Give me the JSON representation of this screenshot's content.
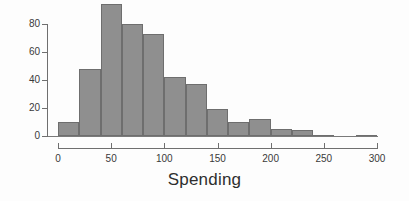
{
  "chart_data": {
    "type": "bar",
    "title": "",
    "subtitle": "",
    "xlabel": "Spending",
    "ylabel": "",
    "xlim": [
      0,
      310
    ],
    "ylim": [
      0,
      95
    ],
    "grid": false,
    "legend": null,
    "bin_width": 20,
    "x_ticks": [
      0,
      50,
      100,
      150,
      200,
      250,
      300
    ],
    "x_tick_labels": [
      "0",
      "50",
      "100",
      "150",
      "200",
      "250",
      "300"
    ],
    "y_ticks": [
      0,
      20,
      40,
      60,
      80
    ],
    "y_tick_labels": [
      "0",
      "20",
      "40",
      "60",
      "80"
    ],
    "bin_edges": [
      0,
      20,
      40,
      60,
      80,
      100,
      120,
      140,
      160,
      180,
      200,
      220,
      240,
      260,
      280,
      300
    ],
    "categories": [
      "0-20",
      "20-40",
      "40-60",
      "60-80",
      "80-100",
      "100-120",
      "120-140",
      "140-160",
      "160-180",
      "180-200",
      "200-220",
      "220-240",
      "240-260",
      "260-280",
      "280-300"
    ],
    "values": [
      10,
      48,
      94,
      80,
      73,
      42,
      37,
      19,
      10,
      12,
      5,
      4,
      1,
      0,
      1
    ],
    "series": [
      {
        "name": "Spending frequency",
        "values": [
          10,
          48,
          94,
          80,
          73,
          42,
          37,
          19,
          10,
          12,
          5,
          4,
          1,
          0,
          1
        ]
      }
    ],
    "bar_fill_color": "#8f8f8f",
    "bar_border_color": "#6e6e6e",
    "axis_color": "#6f6f6f",
    "background_color": "#fdfdfd",
    "text_color": "#3a3a3a"
  }
}
